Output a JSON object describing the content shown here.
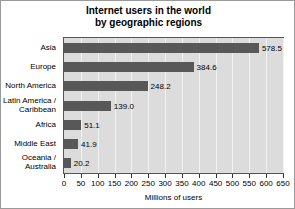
{
  "chart_data": {
    "type": "bar",
    "orientation": "horizontal",
    "title": "Internet users in the world by geographic regions",
    "title_lines": [
      "Internet users in the world",
      "by geographic regions"
    ],
    "xlabel": "Millions of users",
    "ylabel": "",
    "categories": [
      "Asia",
      "Europe",
      "North America",
      "Latin America /\nCaribbean",
      "Africa",
      "Middle East",
      "Oceania /\nAustralia"
    ],
    "values": [
      578.5,
      384.6,
      248.2,
      139.0,
      51.1,
      41.9,
      20.2
    ],
    "value_labels": [
      "578.5",
      "384.6",
      "248.2",
      "139.0",
      "51.1",
      "41.9",
      "20.2"
    ],
    "xlim": [
      0,
      650
    ],
    "xticks": [
      0,
      50,
      100,
      150,
      200,
      250,
      300,
      350,
      400,
      450,
      500,
      550,
      600,
      650
    ],
    "xtick_labels": [
      "0",
      "50",
      "100",
      "150",
      "200",
      "250",
      "300",
      "350",
      "400",
      "450",
      "500",
      "550",
      "600",
      "650"
    ],
    "grid": true,
    "legend": false,
    "colors": {
      "bar": "#585858",
      "plot_background": "#dcdcdc",
      "gridline": "#f2f2f2",
      "axis": "#555555",
      "text": "#000000",
      "figure_background": "#ffffff",
      "frame": "#9a9a9a"
    }
  }
}
